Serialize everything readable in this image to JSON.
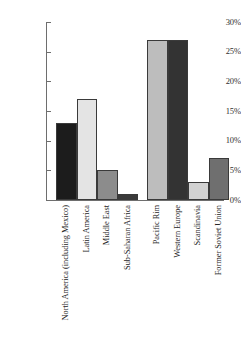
{
  "chart_data": {
    "type": "bar",
    "title": "",
    "xlabel": "",
    "ylabel": "",
    "ylim": [
      0,
      30
    ],
    "grid": false,
    "legend": "none",
    "y_tick_labels": [
      "30%",
      "25%",
      "20%",
      "15%",
      "10%",
      "5%",
      "0%"
    ],
    "y_tick_values": [
      30,
      25,
      20,
      15,
      10,
      5,
      0
    ],
    "categories": [
      "North America (including Mexico)",
      "Latin America",
      "Middle East",
      "Sub-Saharan Africa",
      "Pacific Rim",
      "Western Europe",
      "Scandinavia",
      "Former Soviet Union"
    ],
    "values": [
      13,
      17,
      5,
      1,
      27,
      27,
      3,
      7
    ],
    "value_labels": [
      "13%",
      "17%",
      "5%",
      "1%",
      "27%",
      "27%",
      "3%",
      "7%"
    ],
    "bar_colors": [
      "#1c1c1c",
      "#e4e4e4",
      "#8c8c8c",
      "#3a3a3a",
      "#bdbdbd",
      "#333333",
      "#d2d2d2",
      "#6f6f6f"
    ],
    "bar_border_color": "#3a3a3a",
    "axis_color": "#6e6e6e",
    "background_color": "#ffffff"
  }
}
